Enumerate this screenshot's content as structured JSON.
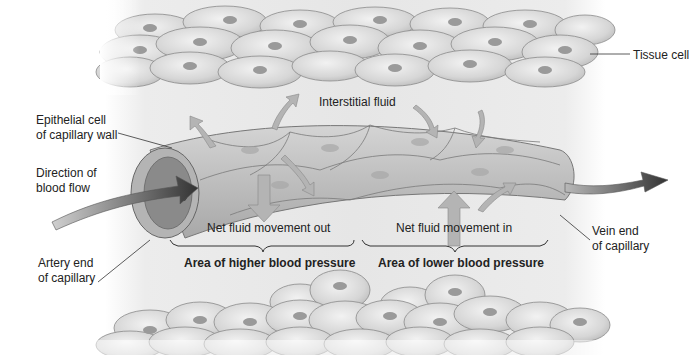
{
  "diagram": {
    "labels": {
      "tissue_cell": "Tissue cell",
      "interstitial_fluid": "Interstitial fluid",
      "epithelial_cell_line1": "Epithelial cell",
      "epithelial_cell_line2": "of capillary wall",
      "direction_line1": "Direction of",
      "direction_line2": "blood flow",
      "artery_line1": "Artery end",
      "artery_line2": "of capillary",
      "vein_line1": "Vein end",
      "vein_line2": "of capillary",
      "net_out": "Net fluid movement out",
      "net_in": "Net fluid movement in",
      "area_higher": "Area of higher blood pressure",
      "area_lower": "Area of lower blood pressure"
    },
    "colors": {
      "cell_fill": "#d8d8d8",
      "cell_nucleus": "#9a9a9a",
      "capillary_fill": "#c4c4c4",
      "fluid_arrow": "#b0b0b0",
      "blood_arrow": "#444444",
      "background": "#e8e8e8"
    }
  }
}
